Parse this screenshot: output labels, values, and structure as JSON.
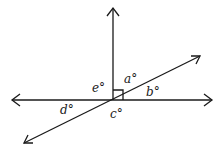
{
  "diagram": {
    "labels": {
      "a": "a°",
      "b": "b°",
      "c": "c°",
      "d": "d°",
      "e": "e°"
    },
    "right_angle_marker": true,
    "color": "#1a1a1a"
  }
}
